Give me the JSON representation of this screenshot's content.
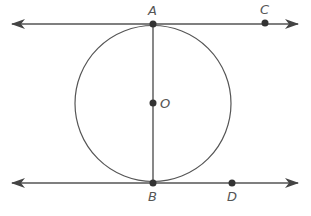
{
  "diagram": {
    "type": "geometry",
    "colors": {
      "stroke": "#555555",
      "point": "#333333",
      "background": "#ffffff"
    },
    "circle": {
      "center_label": "O",
      "cx": 153,
      "cy": 103,
      "r": 77
    },
    "points": [
      {
        "label": "A",
        "x": 153,
        "y": 24
      },
      {
        "label": "C",
        "x": 265,
        "y": 23
      },
      {
        "label": "O",
        "x": 153,
        "y": 103
      },
      {
        "label": "B",
        "x": 153,
        "y": 183
      },
      {
        "label": "D",
        "x": 232,
        "y": 183
      }
    ],
    "lines": [
      {
        "name": "tangent-line-AC",
        "through": [
          "A",
          "C"
        ],
        "y": 24,
        "x1": 12,
        "x2": 298,
        "arrows": "both"
      },
      {
        "name": "tangent-line-BD",
        "through": [
          "B",
          "D"
        ],
        "y": 183,
        "x1": 12,
        "x2": 298,
        "arrows": "both"
      },
      {
        "name": "diameter-AB",
        "from": "A",
        "to": "B"
      }
    ]
  },
  "labels": {
    "A": "A",
    "C": "C",
    "O": "O",
    "B": "B",
    "D": "D"
  }
}
